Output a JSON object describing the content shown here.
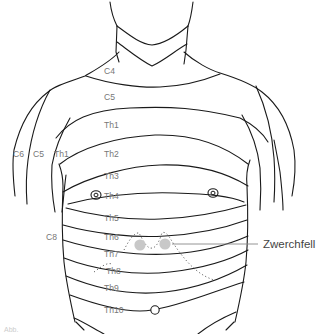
{
  "diagram": {
    "segments_trunk": [
      "C4",
      "C5",
      "Th1",
      "Th2",
      "Th3",
      "Th4",
      "Th5",
      "Th6",
      "Th7",
      "Th8",
      "Th9",
      "Th10"
    ],
    "segments_arm": [
      "C6",
      "C5",
      "Th1"
    ],
    "side_label": "C8",
    "callout": "Zwerchfell",
    "landmarks": [
      "nipple-left",
      "nipple-right",
      "umbilicus",
      "diaphragm-projection"
    ],
    "figure_caption": "Abb."
  },
  "labels": {
    "c4": "C4",
    "c5": "C5",
    "th1": "Th1",
    "th2": "Th2",
    "th3": "Th3",
    "th4": "Th4",
    "th5": "Th5",
    "th6": "Th6",
    "th7": "Th7",
    "th8": "Th8",
    "th9": "Th9",
    "th10": "Th10",
    "arm_c6": "C6",
    "arm_c5": "C5",
    "arm_th1": "Th1",
    "c8": "C8",
    "zwerchfell": "Zwerchfell",
    "caption": "Abb."
  },
  "colors": {
    "line": "#1a1a1a",
    "label": "#777777",
    "diaphragm_marker": "#c8c8c8"
  }
}
